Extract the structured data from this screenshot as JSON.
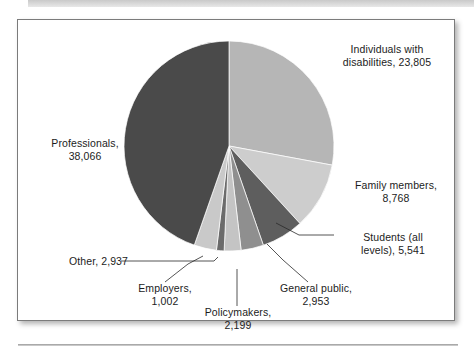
{
  "figure": {
    "background_color": "#ffffff",
    "frame_border_color": "#7b7b7b"
  },
  "chart_data": {
    "type": "pie",
    "title": "",
    "subtitle": "",
    "xlabel": "",
    "ylabel": "",
    "grid": false,
    "legend_position": "callout-labels",
    "total": 85271,
    "start_angle_deg": 0,
    "direction": "clockwise",
    "categories": [
      "Individuals with disabilities",
      "Family members",
      "Students (all levels)",
      "General public",
      "Policymakers",
      "Employers",
      "Other",
      "Professionals"
    ],
    "values": [
      23805,
      8768,
      5541,
      2953,
      2199,
      1002,
      2937,
      38066
    ],
    "percentages": [
      27.92,
      10.28,
      6.5,
      3.46,
      2.58,
      1.18,
      3.44,
      44.64
    ],
    "colors": [
      "#b6b6b6",
      "#cdcdcd",
      "#5e5e5e",
      "#8f8f8f",
      "#c4c4c4",
      "#6b6b6b",
      "#c9c9c9",
      "#4a4a4a"
    ],
    "slices": [
      {
        "label": "Individuals with disabilities",
        "value": 23805,
        "value_text": "23,805",
        "percent": 27.92,
        "color": "#b6b6b6"
      },
      {
        "label": "Family members",
        "value": 8768,
        "value_text": "8,768",
        "percent": 10.28,
        "color": "#cdcdcd"
      },
      {
        "label": "Students (all levels)",
        "value": 5541,
        "value_text": "5,541",
        "percent": 6.5,
        "color": "#5e5e5e"
      },
      {
        "label": "General public",
        "value": 2953,
        "value_text": "2,953",
        "percent": 3.46,
        "color": "#8f8f8f"
      },
      {
        "label": "Policymakers",
        "value": 2199,
        "value_text": "2,199",
        "percent": 2.58,
        "color": "#c4c4c4"
      },
      {
        "label": "Employers",
        "value": 1002,
        "value_text": "1,002",
        "percent": 1.18,
        "color": "#6b6b6b"
      },
      {
        "label": "Other",
        "value": 2937,
        "value_text": "2,937",
        "percent": 3.44,
        "color": "#c9c9c9"
      },
      {
        "label": "Professionals",
        "value": 38066,
        "value_text": "38,066",
        "percent": 44.64,
        "color": "#4a4a4a"
      }
    ]
  },
  "labels": {
    "individuals": "Individuals with\ndisabilities, 23,805",
    "family": "Family members,\n8,768",
    "students": "Students (all\nlevels), 5,541",
    "general_public": "General public,\n2,953",
    "policymakers": "Policymakers,\n2,199",
    "employers": "Employers,\n1,002",
    "other": "Other, 2,937",
    "professionals": "Professionals,\n38,066"
  }
}
